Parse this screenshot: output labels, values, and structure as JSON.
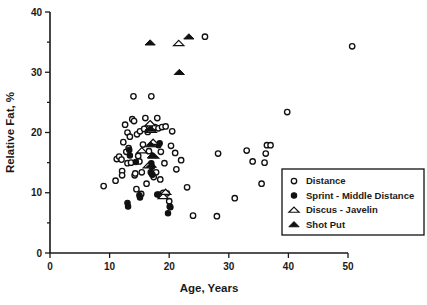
{
  "chart_data": {
    "type": "scatter",
    "title": "",
    "xlabel": "Age, Years",
    "ylabel": "Relative Fat, %",
    "xlim": [
      0,
      50
    ],
    "ylim": [
      0,
      40
    ],
    "xticks": [
      0,
      10,
      20,
      30,
      40,
      50
    ],
    "yticks": [
      0,
      10,
      20,
      30,
      40
    ],
    "y_minor_ticks": [
      5,
      15,
      25,
      35
    ],
    "grid": false,
    "legend_position": "lower-right",
    "legend": [
      {
        "label": "Distance",
        "marker": "open-circle"
      },
      {
        "label": "Sprint - Middle Distance",
        "marker": "filled-circle"
      },
      {
        "label": "Discus - Javelin",
        "marker": "open-triangle"
      },
      {
        "label": "Shot Put",
        "marker": "filled-triangle"
      }
    ],
    "series": [
      {
        "name": "Distance",
        "marker": "open-circle",
        "points": [
          [
            9.0,
            11.1
          ],
          [
            11.0,
            12.0
          ],
          [
            11.2,
            15.6
          ],
          [
            11.6,
            16.0
          ],
          [
            12.0,
            15.5
          ],
          [
            12.1,
            13.6
          ],
          [
            12.1,
            12.9
          ],
          [
            12.3,
            18.4
          ],
          [
            12.6,
            21.3
          ],
          [
            12.8,
            16.8
          ],
          [
            13.0,
            14.9
          ],
          [
            13.0,
            20.0
          ],
          [
            13.2,
            17.4
          ],
          [
            13.4,
            19.3
          ],
          [
            13.6,
            15.0
          ],
          [
            13.8,
            22.2
          ],
          [
            14.0,
            26.0
          ],
          [
            14.1,
            21.9
          ],
          [
            14.2,
            12.9
          ],
          [
            14.3,
            13.2
          ],
          [
            14.5,
            10.6
          ],
          [
            14.6,
            19.7
          ],
          [
            14.8,
            16.1
          ],
          [
            15.0,
            15.2
          ],
          [
            15.1,
            20.2
          ],
          [
            15.3,
            9.8
          ],
          [
            15.4,
            13.4
          ],
          [
            15.6,
            18.0
          ],
          [
            15.8,
            20.6
          ],
          [
            16.0,
            22.4
          ],
          [
            16.2,
            11.5
          ],
          [
            16.4,
            20.1
          ],
          [
            16.6,
            16.9
          ],
          [
            16.8,
            21.2
          ],
          [
            17.0,
            26.0
          ],
          [
            17.1,
            13.1
          ],
          [
            17.2,
            20.5
          ],
          [
            17.4,
            12.6
          ],
          [
            17.6,
            20.9
          ],
          [
            17.8,
            13.4
          ],
          [
            18.0,
            22.4
          ],
          [
            18.2,
            20.7
          ],
          [
            18.3,
            9.7
          ],
          [
            18.5,
            12.2
          ],
          [
            18.6,
            16.8
          ],
          [
            18.8,
            20.9
          ],
          [
            19.0,
            10.0
          ],
          [
            19.2,
            14.9
          ],
          [
            19.4,
            21.0
          ],
          [
            19.6,
            9.9
          ],
          [
            20.0,
            8.6
          ],
          [
            20.1,
            7.7
          ],
          [
            20.3,
            17.8
          ],
          [
            20.5,
            20.2
          ],
          [
            21.0,
            16.6
          ],
          [
            21.2,
            13.9
          ],
          [
            22.0,
            15.4
          ],
          [
            23.0,
            10.9
          ],
          [
            24.0,
            6.2
          ],
          [
            26.0,
            35.9
          ],
          [
            28.0,
            6.1
          ],
          [
            28.2,
            16.5
          ],
          [
            31.0,
            9.1
          ],
          [
            33.0,
            17.0
          ],
          [
            34.0,
            15.2
          ],
          [
            35.5,
            11.5
          ],
          [
            36.0,
            15.0
          ],
          [
            36.2,
            16.5
          ],
          [
            36.4,
            17.9
          ],
          [
            37.0,
            17.9
          ],
          [
            39.8,
            23.4
          ],
          [
            50.7,
            34.3
          ]
        ]
      },
      {
        "name": "Sprint - Middle Distance",
        "marker": "filled-circle",
        "points": [
          [
            13.0,
            8.3
          ],
          [
            13.1,
            7.7
          ],
          [
            13.3,
            17.1
          ],
          [
            13.4,
            16.2
          ],
          [
            14.4,
            15.1
          ],
          [
            15.0,
            9.6
          ],
          [
            15.1,
            9.2
          ],
          [
            16.9,
            13.4
          ],
          [
            17.0,
            14.9
          ],
          [
            17.1,
            14.3
          ],
          [
            17.2,
            13.0
          ],
          [
            18.0,
            9.7
          ],
          [
            18.2,
            17.9
          ],
          [
            18.4,
            18.2
          ],
          [
            19.8,
            6.6
          ],
          [
            20.2,
            7.6
          ]
        ]
      },
      {
        "name": "Discus - Javelin",
        "marker": "open-triangle",
        "points": [
          [
            15.4,
            17.0
          ],
          [
            16.5,
            14.5
          ],
          [
            16.8,
            21.5
          ],
          [
            17.0,
            20.4
          ],
          [
            17.3,
            18.4
          ],
          [
            17.4,
            16.1
          ],
          [
            19.0,
            9.4
          ],
          [
            19.4,
            10.1
          ],
          [
            21.6,
            34.8
          ]
        ]
      },
      {
        "name": "Shot Put",
        "marker": "filled-triangle",
        "points": [
          [
            16.8,
            20.6
          ],
          [
            17.2,
            16.2
          ],
          [
            16.9,
            18.0
          ],
          [
            17.0,
            14.6
          ],
          [
            16.8,
            34.9
          ],
          [
            21.7,
            30.0
          ],
          [
            23.3,
            35.9
          ]
        ]
      }
    ]
  }
}
